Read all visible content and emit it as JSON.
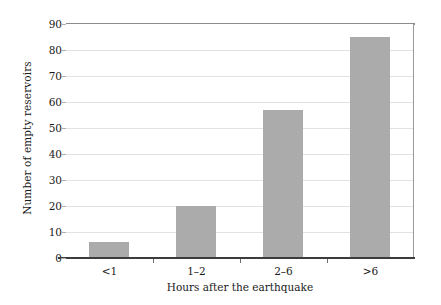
{
  "chart_data": {
    "type": "bar",
    "title": "",
    "categories": [
      "<1",
      "1–2",
      "2–6",
      ">6"
    ],
    "values": [
      6,
      20,
      57,
      85
    ],
    "series": [
      {
        "name": "Number of empty reservoirs",
        "values": [
          6,
          20,
          57,
          85
        ]
      }
    ],
    "xlabel": "Hours after the earthquake",
    "ylabel": "Number of empty reservoirs",
    "ylim": [
      0,
      90
    ],
    "yticks": [
      0,
      10,
      20,
      30,
      40,
      50,
      60,
      70,
      80,
      90
    ],
    "ytick_labels": [
      "0",
      "10",
      "20",
      "30",
      "40",
      "50",
      "60",
      "70",
      "80",
      "90"
    ],
    "grid": true,
    "grid_axis": "y",
    "legend": false,
    "legend_position": "none",
    "bar_color": "#ababab",
    "grid_color": "#e2e2e2",
    "axis_color": "#3c3c3c",
    "background_color": "#ffffff",
    "text_color": "#1a1a1a"
  }
}
